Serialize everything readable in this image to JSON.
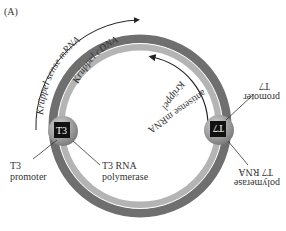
{
  "panel_label": "(A)",
  "plasmid": {
    "cdna_label": "Krüppel cDNA",
    "colors": {
      "outer_ring": "#707070",
      "inner_ring": "#b5b5b5",
      "white_line": "#ffffff",
      "promoter_box": "#111111",
      "polymerase_ball": "#9a9a9a"
    }
  },
  "left": {
    "transcript_label": "Krüppel sense mRNA",
    "promoter_box_label": "T3",
    "promoter_label_line1": "T3",
    "promoter_label_line2": "promoter",
    "polymerase_label_line1": "T3 RNA",
    "polymerase_label_line2": "polymerase"
  },
  "right": {
    "transcript_label_line1": "Krüppel",
    "transcript_label_line2": "antisense mRNA",
    "promoter_box_label": "T7",
    "promoter_label_line1": "T7",
    "promoter_label_line2": "promoter",
    "polymerase_label_line1": "T7 RNA",
    "polymerase_label_line2": "polymerase"
  }
}
